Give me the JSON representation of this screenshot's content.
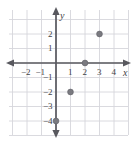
{
  "chart_data": {
    "type": "scatter",
    "title": "",
    "xlabel": "x",
    "ylabel": "y",
    "xlim": [
      -3.25,
      5.0
    ],
    "ylim": [
      -5.65,
      3.65
    ],
    "grid": true,
    "legend": null,
    "x_ticks": [
      -2,
      -1,
      1,
      2,
      3,
      4
    ],
    "y_ticks": [
      2,
      1,
      -1,
      -2,
      -3,
      -4
    ],
    "x_tick_labels": [
      "−2",
      "−1",
      "1",
      "2",
      "3",
      "4"
    ],
    "y_tick_labels": [
      "2",
      "1",
      "−1",
      "−2",
      "−3",
      "−4"
    ],
    "points": [
      {
        "x": 3,
        "y": 2,
        "label": "(3, 2)"
      },
      {
        "x": 2,
        "y": 0,
        "label": "(2, 0)"
      },
      {
        "x": 1,
        "y": -2,
        "label": "(1, -2)"
      },
      {
        "x": 0,
        "y": -4,
        "label": "(0, -4)"
      }
    ],
    "colors": {
      "point": "#7a7a80",
      "point_edge": "#5f5f66",
      "grid": "#d6d6db",
      "axis": "#58585e",
      "text": "#3f3f46",
      "background": "#ffffff"
    }
  },
  "geometry": {
    "width": 136,
    "height": 147,
    "origin_x": 56,
    "origin_y": 63,
    "unit": 14.5,
    "grid_left": 9,
    "grid_right": 128,
    "grid_top": 10,
    "grid_bottom": 135
  }
}
